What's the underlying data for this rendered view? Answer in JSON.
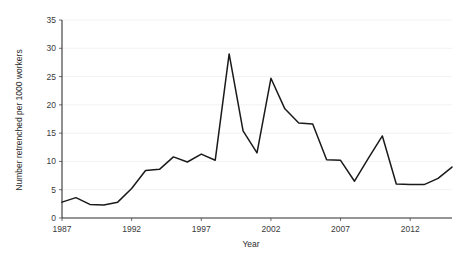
{
  "chart_data": {
    "type": "line",
    "title": "",
    "xlabel": "Year",
    "ylabel": "Number retrenched per 1000 workers",
    "xlim": [
      1987,
      2015
    ],
    "ylim": [
      0,
      35
    ],
    "grid": true,
    "legend": null,
    "x_ticks": [
      1987,
      1992,
      1997,
      2002,
      2007,
      2012
    ],
    "y_ticks": [
      0,
      5,
      10,
      15,
      20,
      25,
      30,
      35
    ],
    "series": [
      {
        "name": "Number retrenched per 1000 workers",
        "color": "#1a1a1a",
        "x": [
          1987,
          1988,
          1989,
          1990,
          1991,
          1992,
          1993,
          1994,
          1995,
          1996,
          1997,
          1998,
          1999,
          2000,
          2001,
          2002,
          2003,
          2004,
          2005,
          2006,
          2007,
          2008,
          2009,
          2010,
          2011,
          2012,
          2013,
          2014,
          2015
        ],
        "values": [
          2.8,
          3.6,
          2.4,
          2.3,
          2.8,
          5.2,
          8.4,
          8.6,
          10.8,
          9.9,
          11.3,
          10.2,
          29.0,
          15.4,
          11.5,
          24.7,
          19.3,
          16.8,
          16.6,
          10.3,
          10.2,
          6.5,
          10.6,
          14.5,
          6.0,
          5.9,
          5.9,
          7.0,
          9.0
        ]
      }
    ]
  },
  "axes": {
    "y_axis_label": "Number retrenched per 1000 workers",
    "x_axis_label": "Year",
    "y_tick_labels": [
      "0",
      "5",
      "10",
      "15",
      "20",
      "25",
      "30",
      "35"
    ],
    "x_tick_labels": [
      "1987",
      "1992",
      "1997",
      "2002",
      "2007",
      "2012"
    ]
  }
}
